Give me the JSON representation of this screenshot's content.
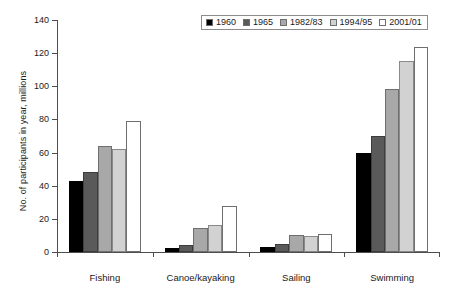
{
  "chart_data": {
    "type": "bar",
    "title": "",
    "xlabel": "",
    "ylabel": "No. of participants in year, millions",
    "ylim": [
      0,
      140
    ],
    "yticks": [
      0,
      20,
      40,
      60,
      80,
      100,
      120,
      140
    ],
    "grid": false,
    "legend_position": "top-right",
    "categories": [
      "Fishing",
      "Canoe/kayaking",
      "Sailing",
      "Swimming"
    ],
    "series": [
      {
        "name": "1960",
        "color": "#000000",
        "values": [
          43,
          2.5,
          3,
          60
        ]
      },
      {
        "name": "1965",
        "color": "#5a5a5a",
        "values": [
          48.5,
          4,
          5,
          70
        ]
      },
      {
        "name": "1982/83",
        "color": "#a8a8a8",
        "values": [
          64,
          14.5,
          10,
          98.5
        ]
      },
      {
        "name": "1994/95",
        "color": "#d2d2d2",
        "values": [
          62,
          16.5,
          9.5,
          115
        ]
      },
      {
        "name": "2001/01",
        "color": "#ffffff",
        "values": [
          79,
          27.5,
          11,
          124
        ]
      }
    ]
  },
  "axis": {
    "y_title": "No. of participants in year, millions",
    "y_tick_labels": [
      "0",
      "20",
      "40",
      "60",
      "80",
      "100",
      "120",
      "140"
    ],
    "x_tick_labels": [
      "Fishing",
      "Canoe/kayaking",
      "Sailing",
      "Swimming"
    ]
  },
  "legend": {
    "items": [
      {
        "label": "1960"
      },
      {
        "label": "1965"
      },
      {
        "label": "1982/83"
      },
      {
        "label": "1994/95"
      },
      {
        "label": "2001/01"
      }
    ]
  }
}
